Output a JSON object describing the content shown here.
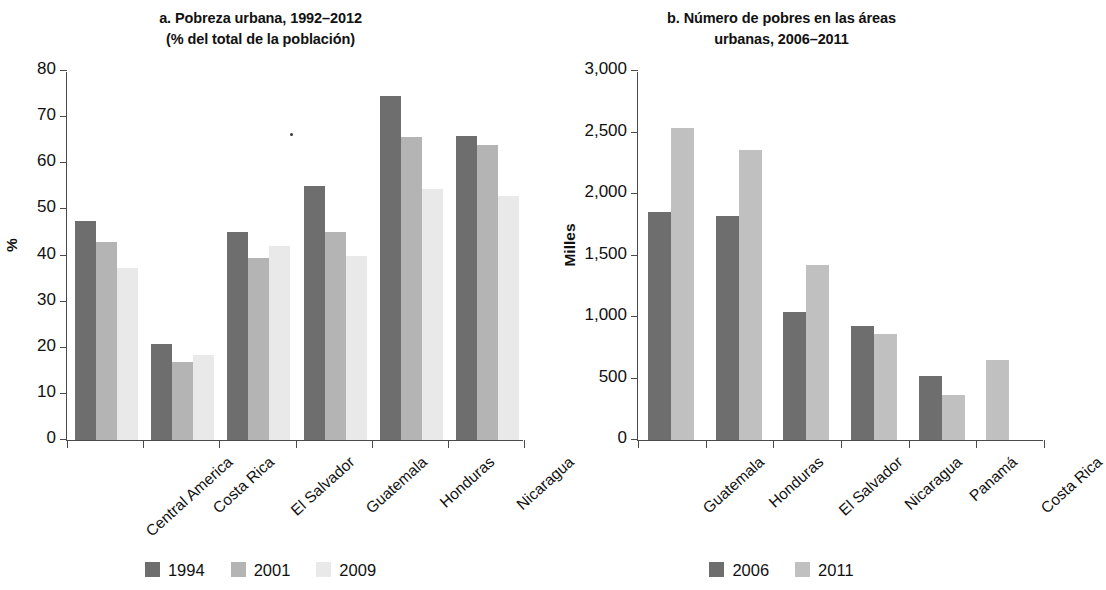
{
  "figure": {
    "background": "#ffffff",
    "panels": [
      "a",
      "b"
    ]
  },
  "panel_a": {
    "title_line1": "a. Pobreza urbana, 1992–2012",
    "title_line2": "(% del total de la  población)",
    "ylabel": "%",
    "yticks": [
      "0",
      "10",
      "20",
      "30",
      "40",
      "50",
      "60",
      "70",
      "80"
    ],
    "xlabels": [
      "Central America",
      "Costa Rica",
      "El Salvador",
      "Guatemala",
      "Honduras",
      "Nicaragua"
    ],
    "legend": [
      {
        "label": "1994",
        "color": "#6e6e6e"
      },
      {
        "label": "2001",
        "color": "#b4b4b4"
      },
      {
        "label": "2009",
        "color": "#e9e9e9"
      }
    ]
  },
  "panel_b": {
    "title_line1": "b. Número de pobres en las áreas",
    "title_line2": "urbanas, 2006–2011",
    "ylabel": "Milles",
    "yticks": [
      "0",
      "500",
      "1,000",
      "1,500",
      "2,000",
      "2,500",
      "3,000"
    ],
    "xlabels": [
      "Guatemala",
      "Honduras",
      "El Salvador",
      "Nicaragua",
      "Panamá",
      "Costa Rica"
    ],
    "legend": [
      {
        "label": "2006",
        "color": "#6e6e6e"
      },
      {
        "label": "2011",
        "color": "#c0c0c0"
      }
    ]
  },
  "chart_data": [
    {
      "type": "bar",
      "panel": "a",
      "title": "a. Pobreza urbana, 1992–2012 (% del total de la  población)",
      "xlabel": "",
      "ylabel": "%",
      "ylim": [
        0,
        80
      ],
      "ytick_step": 10,
      "grid": false,
      "legend_position": "bottom-center",
      "categories": [
        "Central America",
        "Costa Rica",
        "El Salvador",
        "Guatemala",
        "Honduras",
        "Nicaragua"
      ],
      "series": [
        {
          "name": "1994",
          "color": "#6e6e6e",
          "values": [
            47.5,
            20.8,
            45.0,
            55.0,
            74.5,
            66.0
          ]
        },
        {
          "name": "2001",
          "color": "#b4b4b4",
          "values": [
            43.0,
            17.0,
            39.5,
            45.0,
            65.7,
            64.0
          ]
        },
        {
          "name": "2009",
          "color": "#e9e9e9",
          "values": [
            37.4,
            18.4,
            42.1,
            40.0,
            54.4,
            53.0
          ]
        }
      ]
    },
    {
      "type": "bar",
      "panel": "b",
      "title": "b. Número de pobres en las áreas urbanas, 2006–2011",
      "xlabel": "",
      "ylabel": "Milles",
      "ylim": [
        0,
        3000
      ],
      "ytick_step": 500,
      "grid": false,
      "legend_position": "bottom-center",
      "categories": [
        "Guatemala",
        "Honduras",
        "El Salvador",
        "Nicaragua",
        "Panamá",
        "Costa Rica"
      ],
      "series": [
        {
          "name": "2006",
          "color": "#6e6e6e",
          "values": [
            1850,
            1820,
            1040,
            930,
            520,
            null
          ]
        },
        {
          "name": "2011",
          "color": "#c0c0c0",
          "values": [
            2540,
            2360,
            1420,
            860,
            370,
            650
          ]
        }
      ]
    }
  ]
}
